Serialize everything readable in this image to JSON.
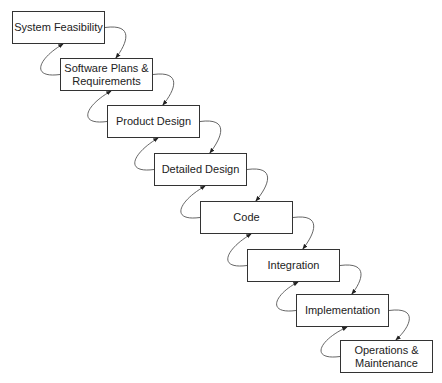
{
  "diagram": {
    "type": "waterfall-model",
    "stages": [
      {
        "label": "System Feasibility",
        "x": 12,
        "y": 11
      },
      {
        "label": "Software Plans &\nRequirements",
        "x": 60,
        "y": 58
      },
      {
        "label": "Product Design",
        "x": 107,
        "y": 105
      },
      {
        "label": "Detailed Design",
        "x": 154,
        "y": 153
      },
      {
        "label": "Code",
        "x": 200,
        "y": 201
      },
      {
        "label": "Integration",
        "x": 247,
        "y": 249
      },
      {
        "label": "Implementation",
        "x": 296,
        "y": 294
      },
      {
        "label": "Operations &\nMaintenance",
        "x": 340,
        "y": 340
      }
    ],
    "box_width": 93,
    "box_height": 33,
    "forward_arrows": 7,
    "feedback_arrows": 7
  }
}
